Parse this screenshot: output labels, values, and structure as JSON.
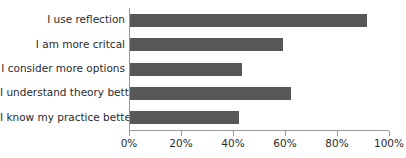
{
  "chart_data": {
    "type": "bar",
    "orientation": "horizontal",
    "title": "",
    "subtitle": "",
    "xlabel": "",
    "ylabel": "",
    "xlim": [
      0,
      100
    ],
    "grid": false,
    "legend": false,
    "bar_color": "#575757",
    "axis_color": "#9a9a9a",
    "text_color": "#2b2b2b",
    "categories": [
      "I use reflection",
      "I am more critcal",
      "I consider more options",
      "I understand theory better",
      "I know my practice better"
    ],
    "values": [
      91,
      59,
      43,
      62,
      42
    ],
    "xticks": [
      0,
      20,
      40,
      60,
      80,
      100
    ],
    "xticklabels": [
      "0%",
      "20%",
      "40%",
      "60%",
      "80%",
      "100%"
    ]
  }
}
